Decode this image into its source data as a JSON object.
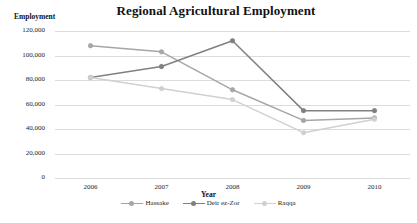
{
  "chart_data": {
    "type": "line",
    "title": "Regional Agricultural Employment",
    "xlabel": "Year",
    "ylabel": "Employment",
    "categories": [
      "2006",
      "2007",
      "2008",
      "2009",
      "2010"
    ],
    "x": [
      2006,
      2007,
      2008,
      2009,
      2010
    ],
    "ylim": [
      0,
      120000
    ],
    "ytick_values": [
      0,
      20000,
      40000,
      60000,
      80000,
      100000,
      120000
    ],
    "ytick_labels": [
      "0",
      "20,000",
      "40,000",
      "60,000",
      "80,000",
      "100,000",
      "120,000"
    ],
    "grid": true,
    "legend_position": "bottom",
    "series": [
      {
        "name": "Hassake",
        "color": "#a6a6a6",
        "marker": "circle",
        "values": [
          108000,
          103000,
          72000,
          47000,
          49000
        ]
      },
      {
        "name": "Deir ez-Zor",
        "color": "#808080",
        "marker": "circle",
        "values": [
          82000,
          91000,
          112000,
          55000,
          55000
        ]
      },
      {
        "name": "Raqqa",
        "color": "#d0d0d0",
        "marker": "circle",
        "values": [
          82000,
          73000,
          64000,
          37000,
          48000
        ]
      }
    ]
  },
  "caption": {
    "text": ""
  }
}
